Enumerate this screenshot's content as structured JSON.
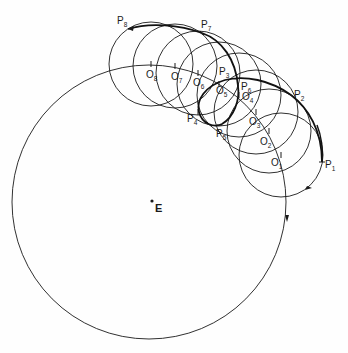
{
  "diagram": {
    "type": "epicycle-retrograde-motion",
    "center": {
      "label": "E",
      "x": 152,
      "y": 201
    },
    "deferent": {
      "cx": 149,
      "cy": 202,
      "r": 137
    },
    "epicycle_radius": 42,
    "epicycle_centers": [
      {
        "label": "O",
        "sub": "1",
        "x": 281,
        "y": 155
      },
      {
        "label": "O",
        "sub": "2",
        "x": 269,
        "y": 131
      },
      {
        "label": "O",
        "sub": "3",
        "x": 256,
        "y": 112
      },
      {
        "label": "O",
        "sub": "4",
        "x": 239,
        "y": 95
      },
      {
        "label": "O",
        "sub": "5",
        "x": 219,
        "y": 84
      },
      {
        "label": "O",
        "sub": "6",
        "x": 198,
        "y": 73
      },
      {
        "label": "O",
        "sub": "7",
        "x": 175,
        "y": 66
      },
      {
        "label": "O",
        "sub": "8",
        "x": 151,
        "y": 64
      }
    ],
    "planet_positions": [
      {
        "label": "P",
        "sub": "1",
        "x": 322,
        "y": 162
      },
      {
        "label": "P",
        "sub": "2",
        "x": 291,
        "y": 95
      },
      {
        "label": "P",
        "sub": "3",
        "x": 219,
        "y": 82
      },
      {
        "label": "P",
        "sub": "4",
        "x": 198,
        "y": 112
      },
      {
        "label": "P",
        "sub": "5",
        "x": 219,
        "y": 125
      },
      {
        "label": "P",
        "sub": "6",
        "x": 238,
        "y": 86
      },
      {
        "label": "P",
        "sub": "7",
        "x": 202,
        "y": 33
      },
      {
        "label": "P",
        "sub": "8",
        "x": 128,
        "y": 29
      }
    ]
  },
  "labels": {
    "E": "E",
    "O1": "O",
    "O1s": "1",
    "O2": "O",
    "O2s": "2",
    "O3": "O",
    "O3s": "3",
    "O4": "O",
    "O4s": "4",
    "O5": "O",
    "O5s": "5",
    "O6": "O",
    "O6s": "6",
    "O7": "O",
    "O7s": "7",
    "O8": "O",
    "O8s": "8",
    "P1": "P",
    "P1s": "1",
    "P2": "P",
    "P2s": "2",
    "P3": "P",
    "P3s": "3",
    "P4": "P",
    "P4s": "4",
    "P5": "P",
    "P5s": "5",
    "P6": "P",
    "P6s": "6",
    "P7": "P",
    "P7s": "7",
    "P8": "P",
    "P8s": "8"
  },
  "colors": {
    "ink": "#1a1a1a",
    "paper": "#fefefe"
  }
}
